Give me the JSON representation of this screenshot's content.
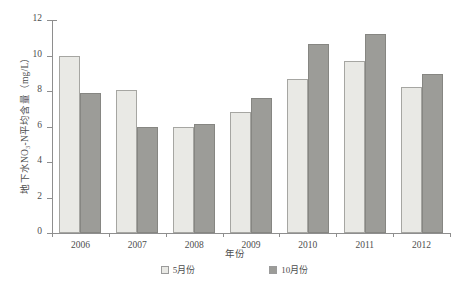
{
  "chart_data": {
    "type": "bar",
    "title": "",
    "xlabel": "年份",
    "ylabel": "地下水NO₃-N平均含量（mg/L）",
    "categories": [
      "2006",
      "2007",
      "2008",
      "2009",
      "2010",
      "2011",
      "2012"
    ],
    "series": [
      {
        "name": "5月份",
        "color": "#e9e9e5",
        "values": [
          10.0,
          8.05,
          5.95,
          6.8,
          8.7,
          9.7,
          8.25
        ]
      },
      {
        "name": "10月份",
        "color": "#9c9c98",
        "values": [
          7.9,
          6.0,
          6.15,
          7.6,
          10.65,
          11.2,
          8.95
        ]
      }
    ],
    "ylim": [
      0,
      12
    ],
    "yticks": [
      0,
      2,
      4,
      6,
      8,
      10,
      12
    ],
    "grid": false,
    "legend_position": "bottom"
  }
}
